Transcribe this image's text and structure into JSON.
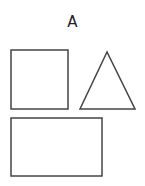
{
  "diagram": {
    "title": "A",
    "stroke_color": "#444444",
    "background": "#ffffff",
    "shapes": [
      {
        "type": "square",
        "x": 11,
        "y": 50,
        "width": 57,
        "height": 59
      },
      {
        "type": "triangle",
        "points": [
          [
            107,
            52
          ],
          [
            80,
            109
          ],
          [
            135,
            109
          ]
        ]
      },
      {
        "type": "rectangle",
        "x": 11,
        "y": 118,
        "width": 91,
        "height": 58
      }
    ]
  }
}
